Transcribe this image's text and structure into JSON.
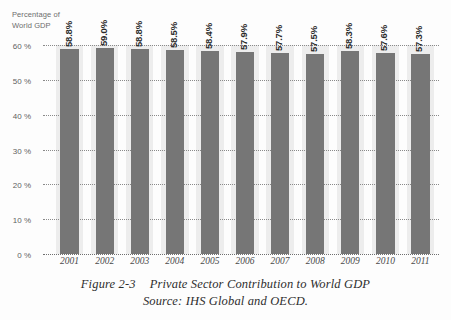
{
  "axis_title": "Percentage of\nWorld GDP",
  "caption": {
    "figure_number": "Figure 2-3",
    "title": "Private Sector Contribution to World GDP",
    "source": "Source: IHS Global and OECD."
  },
  "colors": {
    "bar": "#767676",
    "band": "#ededed",
    "gridline": "#8a8a8a",
    "label_text": "#2b2b2b",
    "tick_text": "#5f5f5f",
    "background": "#fdfdfd"
  },
  "chart_data": {
    "type": "bar",
    "title": "Private Sector Contribution to World GDP",
    "xlabel": "",
    "ylabel": "Percentage of World GDP",
    "categories": [
      "2001",
      "2002",
      "2003",
      "2004",
      "2005",
      "2006",
      "2007",
      "2008",
      "2009",
      "2010",
      "2011"
    ],
    "values": [
      58.8,
      59.0,
      58.8,
      58.5,
      58.4,
      57.9,
      57.7,
      57.5,
      58.3,
      57.6,
      57.3
    ],
    "data_labels": [
      "58.8%",
      "59.0%",
      "58.8%",
      "58.5%",
      "58.4%",
      "57.9%",
      "57.7%",
      "57.5%",
      "58.3%",
      "57.6%",
      "57.3%"
    ],
    "ylim": [
      0,
      60
    ],
    "yticks": [
      0,
      10,
      20,
      30,
      40,
      50,
      60
    ],
    "ytick_labels": [
      "0 %",
      "10 %",
      "20 %",
      "30 %",
      "40 %",
      "50 %",
      "60 %"
    ],
    "grid": true,
    "grid_style": "dotted-horizontal",
    "legend": null,
    "series": [
      {
        "name": "Private Sector Contribution",
        "values": [
          58.8,
          59.0,
          58.8,
          58.5,
          58.4,
          57.9,
          57.7,
          57.5,
          58.3,
          57.6,
          57.3
        ]
      }
    ]
  }
}
